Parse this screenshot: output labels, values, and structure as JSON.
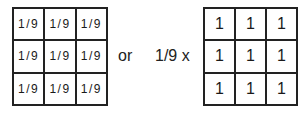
{
  "left_kernel": {
    "cells": [
      [
        "1/9",
        "1/9",
        "1/9"
      ],
      [
        "1/9",
        "1/9",
        "1/9"
      ],
      [
        "1/9",
        "1/9",
        "1/9"
      ]
    ]
  },
  "connector": "or",
  "scale": "1/9 x",
  "right_kernel": {
    "cells": [
      [
        "1",
        "1",
        "1"
      ],
      [
        "1",
        "1",
        "1"
      ],
      [
        "1",
        "1",
        "1"
      ]
    ]
  }
}
